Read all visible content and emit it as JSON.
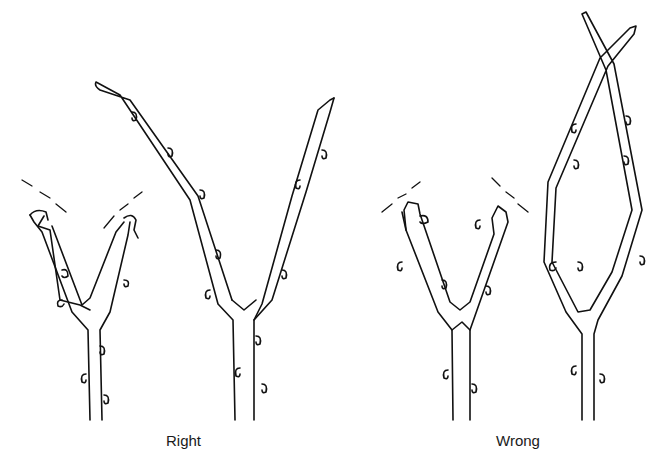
{
  "figure": {
    "labels": {
      "right": "Right",
      "wrong": "Wrong"
    },
    "ink_color": "#111111",
    "background": "#ffffff"
  }
}
